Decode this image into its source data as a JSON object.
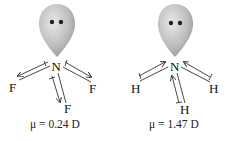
{
  "molecules": [
    {
      "name": "NF3",
      "central_atom": "N",
      "substituents": [
        "F",
        "F",
        "F"
      ],
      "dipole_label": "μ = 0.24 D",
      "bond_dipole_direction": "away-from-central-atom"
    },
    {
      "name": "NH3",
      "central_atom": "N",
      "substituents": [
        "H",
        "H",
        "H"
      ],
      "dipole_label": "μ = 1.47 D",
      "bond_dipole_direction": "toward-central-atom"
    }
  ],
  "colors": {
    "lone_pair_light": "#e6e6e6",
    "lone_pair_dark": "#8a8a8a",
    "electron_dot": "#222222",
    "line": "#333333"
  }
}
